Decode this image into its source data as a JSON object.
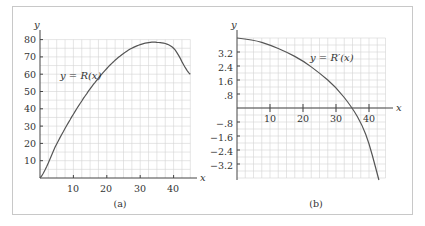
{
  "chart_data": [
    {
      "type": "line",
      "panel_label": "(a)",
      "curve_label": "y = R(x)",
      "xlabel": "x",
      "ylabel": "y",
      "xlim": [
        0,
        45
      ],
      "ylim": [
        0,
        80
      ],
      "x_ticks": [
        10,
        20,
        30,
        40
      ],
      "y_ticks": [
        10,
        20,
        30,
        40,
        50,
        60,
        70,
        80
      ],
      "grid": true,
      "series": [
        {
          "name": "R(x)",
          "x": [
            0,
            5,
            10,
            15,
            20,
            25,
            30,
            35,
            40,
            45
          ],
          "y": [
            0,
            19.7,
            36.9,
            51.5,
            63.3,
            72,
            77.1,
            78.4,
            75,
            60
          ]
        }
      ]
    },
    {
      "type": "line",
      "panel_label": "(b)",
      "curve_label": "y = R′(x)",
      "xlabel": "x",
      "ylabel": "y",
      "xlim": [
        0,
        45
      ],
      "ylim": [
        -4.0,
        4.0
      ],
      "x_ticks": [
        10,
        20,
        30,
        40
      ],
      "y_ticks": [
        -3.2,
        -2.4,
        -1.6,
        -0.8,
        0.8,
        1.6,
        2.4,
        3.2
      ],
      "y_tick_labels": [
        "−3.2",
        "−2.4",
        "−1.6",
        "−.8",
        ".8",
        "1.6",
        "2.4",
        "3.2"
      ],
      "grid": true,
      "series": [
        {
          "name": "R′(x)",
          "x": [
            0,
            5,
            10,
            15,
            20,
            25,
            30,
            35,
            38,
            40,
            42,
            43
          ],
          "y": [
            4.0,
            3.9,
            3.6,
            3.2,
            2.7,
            2.0,
            1.2,
            0.0,
            -1.0,
            -2.0,
            -3.4,
            -4.4
          ]
        }
      ]
    }
  ],
  "labels": {
    "a": {
      "panel": "(a)",
      "curve": "y = R(x)",
      "x": "x",
      "y": "y",
      "xt": [
        "10",
        "20",
        "30",
        "40"
      ],
      "yt": [
        "10",
        "20",
        "30",
        "40",
        "50",
        "60",
        "70",
        "80"
      ]
    },
    "b": {
      "panel": "(b)",
      "curve": "y = R′(x)",
      "x": "x",
      "y": "y",
      "xt": [
        "10",
        "20",
        "30",
        "40"
      ],
      "yt": [
        "3.2",
        "2.4",
        "1.6",
        ".8",
        "−.8",
        "−1.6",
        "−2.4",
        "−3.2"
      ]
    }
  }
}
